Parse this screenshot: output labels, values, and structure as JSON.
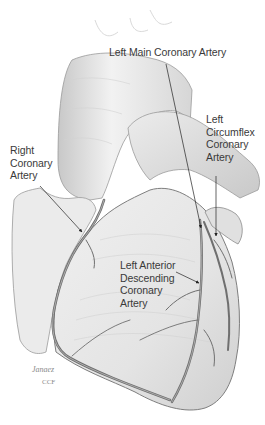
{
  "diagram": {
    "labels": [
      {
        "id": "left-main",
        "text": "Left Main Coronary Artery"
      },
      {
        "id": "left-circumflex",
        "text": "Left\nCircumflex\nCoronary\nArtery"
      },
      {
        "id": "right-coronary",
        "text": "Right\nCoronary\nArtery"
      },
      {
        "id": "lad",
        "text": "Left Anterior\nDescending\nCoronary\nArtery"
      }
    ],
    "signature": {
      "name": "Janaez",
      "org": "CCF"
    }
  }
}
